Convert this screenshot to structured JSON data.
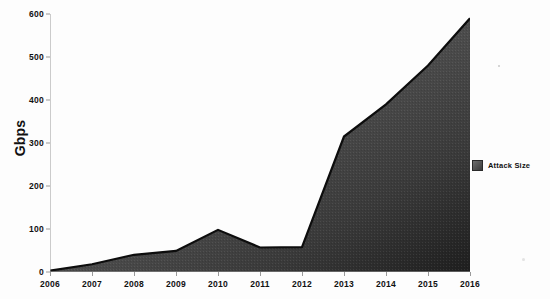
{
  "chart_data": {
    "type": "area",
    "title": "",
    "subtitle": "",
    "xlabel": "",
    "ylabel": "Gbps",
    "categories": [
      "2006",
      "2007",
      "2008",
      "2009",
      "2010",
      "2011",
      "2012",
      "2013",
      "2014",
      "2015",
      "2016"
    ],
    "series": [
      {
        "name": "Attack Size",
        "values": [
          3,
          18,
          40,
          49,
          98,
          57,
          58,
          315,
          390,
          480,
          590
        ]
      }
    ],
    "values": [
      3,
      18,
      40,
      49,
      98,
      57,
      58,
      315,
      390,
      480,
      590
    ],
    "ylim": [
      0,
      600
    ],
    "y_ticks": [
      0,
      100,
      200,
      300,
      400,
      500,
      600
    ],
    "y_tick_labels": [
      "0",
      "100",
      "200",
      "300",
      "400",
      "500",
      "600"
    ],
    "x_tick_labels": [
      "2006",
      "2007",
      "2008",
      "2009",
      "2010",
      "2011",
      "2012",
      "2013",
      "2014",
      "2015",
      "2016"
    ],
    "grid": false,
    "legend_position": "right",
    "legend_entries": [
      "Attack Size"
    ],
    "colors": {
      "series_fill_light": "#6f6f6f",
      "series_fill_dark": "#262626",
      "series_line": "#0d0d0d",
      "axis": "#9a9a9a",
      "text": "#111111",
      "background": "#fdfdfd"
    }
  },
  "axis": {
    "y_title": "Gbps"
  },
  "legend": {
    "items": [
      {
        "label": "Attack Size",
        "swatch_color": "#4a4a4a"
      }
    ]
  }
}
